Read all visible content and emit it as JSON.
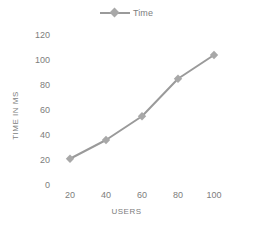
{
  "chart_data": {
    "type": "line",
    "title": "",
    "xlabel": "USERS",
    "ylabel": "TIME IN MS",
    "categories": [
      20,
      40,
      60,
      80,
      100
    ],
    "x": [
      20,
      40,
      60,
      80,
      100
    ],
    "series": [
      {
        "name": "Time",
        "values": [
          21,
          36,
          55,
          85,
          104
        ]
      }
    ],
    "xlim": [
      10,
      110
    ],
    "ylim": [
      0,
      120
    ],
    "x_ticks": [
      "20",
      "40",
      "60",
      "80",
      "100"
    ],
    "y_ticks": [
      "0",
      "20",
      "40",
      "60",
      "80",
      "100",
      "120"
    ],
    "grid": false,
    "legend": {
      "position": "top-center",
      "entries": [
        "Time"
      ]
    },
    "colors": {
      "line": "#9a9a9a",
      "marker": "#a8a8a8",
      "text": "#7d7d7d",
      "background": "#ffffff"
    },
    "marker_style": "diamond"
  }
}
